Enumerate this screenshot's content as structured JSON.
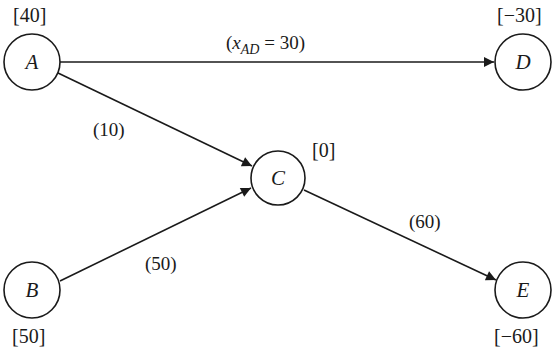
{
  "diagram": {
    "type": "network-flow",
    "nodes": [
      {
        "id": "A",
        "label": "A",
        "supply_label": "[40]"
      },
      {
        "id": "B",
        "label": "B",
        "supply_label": "[50]"
      },
      {
        "id": "C",
        "label": "C",
        "supply_label": "[0]"
      },
      {
        "id": "D",
        "label": "D",
        "supply_label": "[−30]"
      },
      {
        "id": "E",
        "label": "E",
        "supply_label": "[−60]"
      }
    ],
    "edges": [
      {
        "from": "A",
        "to": "D",
        "label_prefix": "(",
        "label_var": "x",
        "label_sub": "AD",
        "label_suffix": " = 30)"
      },
      {
        "from": "A",
        "to": "C",
        "label": "(10)"
      },
      {
        "from": "B",
        "to": "C",
        "label": "(50)"
      },
      {
        "from": "C",
        "to": "E",
        "label": "(60)"
      }
    ]
  }
}
